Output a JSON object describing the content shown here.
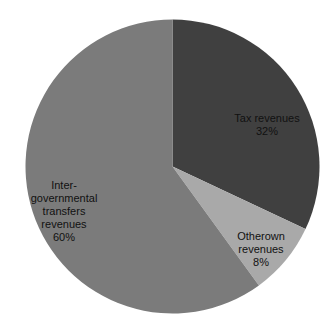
{
  "chart_data": {
    "type": "pie",
    "title": "",
    "legend": "none",
    "background_color": "#ffffff",
    "label_text_color": "#111111",
    "start_angle_deg": 0,
    "direction": "clockwise",
    "geometry": {
      "cx": 172.5,
      "cy": 166.5,
      "r": 147
    },
    "slices": [
      {
        "name": "tax-revenues",
        "label": "Tax revenues",
        "value_pct": 32,
        "color": "#404040",
        "label_lines": [
          "Tax revenues",
          "32%"
        ],
        "label_center": {
          "x": 267,
          "y": 125
        }
      },
      {
        "name": "otherown-revenues",
        "label": "Otherown revenues",
        "value_pct": 8,
        "color": "#a9a9a9",
        "label_lines": [
          "Otherown",
          "revenues",
          "8%"
        ],
        "label_center": {
          "x": 261,
          "y": 249
        }
      },
      {
        "name": "intergovernmental-transfers-revenues",
        "label": "Inter-governmental transfers revenues",
        "value_pct": 60,
        "color": "#7b7b7b",
        "label_lines": [
          "Inter-",
          "governmental",
          "transfers",
          "revenues",
          "60%"
        ],
        "label_center": {
          "x": 64,
          "y": 211
        }
      }
    ]
  }
}
